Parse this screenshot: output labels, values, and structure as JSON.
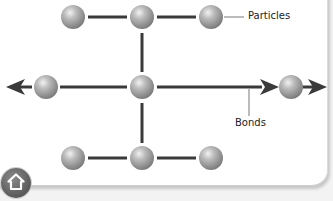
{
  "diagram": {
    "labels": {
      "particles": "Particles",
      "bonds": "Bonds"
    },
    "particle_color": "#a8a8a8",
    "bond_color": "#3a3a3a",
    "particles": [
      {
        "row": "top",
        "x": 73,
        "y": 17
      },
      {
        "row": "top",
        "x": 142,
        "y": 17
      },
      {
        "row": "top",
        "x": 211,
        "y": 17
      },
      {
        "row": "middle",
        "x": 46,
        "y": 87
      },
      {
        "row": "middle",
        "x": 142,
        "y": 87
      },
      {
        "row": "middle",
        "x": 289,
        "y": 87
      },
      {
        "row": "bottom",
        "x": 73,
        "y": 158
      },
      {
        "row": "bottom",
        "x": 142,
        "y": 158
      },
      {
        "row": "bottom",
        "x": 211,
        "y": 158
      }
    ]
  },
  "navigation": {
    "home_icon": "home-icon"
  }
}
